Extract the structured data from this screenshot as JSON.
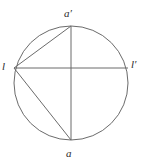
{
  "figure": {
    "type": "circle-with-chords-diagram",
    "background_color": "#ffffff",
    "stroke_color": "#6b6b6b",
    "label_color": "#2b2b2b",
    "canvas": {
      "width": 145,
      "height": 167
    },
    "circle": {
      "name": "main-circle",
      "cx": 71,
      "cy": 83,
      "r": 57
    },
    "points": [
      {
        "id": "a_prime",
        "label": "a′",
        "x": 71,
        "y": 26,
        "position": "top"
      },
      {
        "id": "a",
        "label": "a",
        "x": 71,
        "y": 140,
        "position": "bottom"
      },
      {
        "id": "l",
        "label": "l",
        "x": 14,
        "y": 68,
        "position": "left"
      },
      {
        "id": "l_prime",
        "label": "l′",
        "x": 128,
        "y": 68,
        "position": "right"
      }
    ],
    "segments": [
      {
        "id": "vertical-diameter",
        "from": "a_prime",
        "to": "a"
      },
      {
        "id": "horizontal-chord-l-to-l-prime",
        "from": "l",
        "to": "l_prime"
      },
      {
        "id": "chord-l-to-a-prime",
        "from": "l",
        "to": "a_prime"
      },
      {
        "id": "chord-l-to-a",
        "from": "l",
        "to": "a"
      }
    ]
  },
  "labels": {
    "a_prime": "a′",
    "a": "a",
    "l": "l",
    "l_prime": "l′"
  }
}
